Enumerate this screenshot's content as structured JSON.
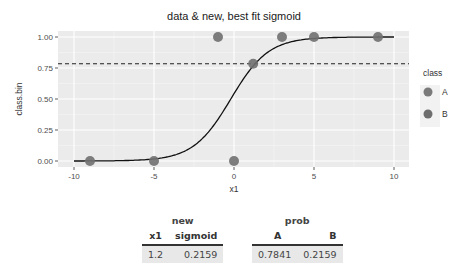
{
  "chart_data": {
    "type": "scatter",
    "title": "data & new, best fit sigmoid",
    "xlabel": "x1",
    "ylabel": "class.bin",
    "xlim": [
      -11,
      11
    ],
    "ylim": [
      -0.05,
      1.05
    ],
    "x_ticks": [
      -10,
      -5,
      0,
      5,
      10
    ],
    "x_tick_labels": [
      "-10",
      "-5",
      "0",
      "5",
      "10"
    ],
    "y_ticks": [
      0,
      0.25,
      0.5,
      0.75,
      1.0
    ],
    "y_tick_labels": [
      "0.00",
      "0.25",
      "0.50",
      "0.75",
      "1.00"
    ],
    "grid": true,
    "legend": {
      "title": "class",
      "position": "right",
      "entries": [
        {
          "label": "A",
          "color": "#7a7a7a"
        },
        {
          "label": "B",
          "color": "#6e6e6e"
        }
      ]
    },
    "series": [
      {
        "name": "data points",
        "type": "scatter",
        "points": [
          {
            "x": -9,
            "y": 0
          },
          {
            "x": -5,
            "y": 0
          },
          {
            "x": 0,
            "y": 0
          },
          {
            "x": -1,
            "y": 1
          },
          {
            "x": 3,
            "y": 1
          },
          {
            "x": 5,
            "y": 1
          },
          {
            "x": 9,
            "y": 1
          },
          {
            "x": 1.2,
            "y": 0.7841
          }
        ]
      },
      {
        "name": "best fit sigmoid",
        "type": "line",
        "x_range": [
          -10,
          10
        ],
        "function": "1/(1+exp(-(x-0.0)*0.9)) shape approx",
        "midpoint_x": -0.2,
        "slope": 0.85
      },
      {
        "name": "threshold",
        "type": "hline",
        "y": 0.7841,
        "style": "dashed"
      }
    ]
  },
  "tables": {
    "new": {
      "title": "new",
      "headers": [
        "x1",
        "sigmoid"
      ],
      "rows": [
        [
          "1.2",
          "0.2159"
        ]
      ]
    },
    "prob": {
      "title": "prob",
      "headers": [
        "A",
        "B"
      ],
      "rows": [
        [
          "0.7841",
          "0.2159"
        ]
      ]
    }
  }
}
